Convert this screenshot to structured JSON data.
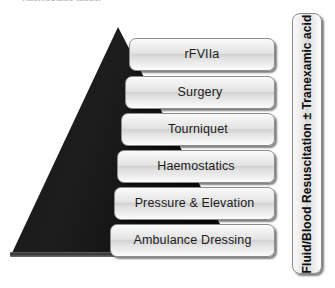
{
  "figure": {
    "title": "Haemostatic ladder",
    "caption_top": "Haemostatic ladder",
    "background_color": "#ffffff"
  },
  "pyramid": {
    "name": "haemostatic-ladder-triangle",
    "fill_color": "#1a1a1a",
    "base_color": "#3b3b3b",
    "apex": {
      "x": 118,
      "y": 27
    },
    "base_left": {
      "x": 12,
      "y": 256
    },
    "base_right": {
      "x": 235,
      "y": 256
    }
  },
  "ladder": {
    "direction_note": "Ambulance Dressing at base to rFVIIa at apex",
    "steps": [
      {
        "label": "rFVIIa",
        "level": 6,
        "left": 129,
        "top": 38
      },
      {
        "label": "Surgery",
        "level": 5,
        "left": 125,
        "top": 76
      },
      {
        "label": "Tourniquet",
        "level": 4,
        "left": 121,
        "top": 113
      },
      {
        "label": "Haemostatics",
        "level": 3,
        "left": 117,
        "top": 150
      },
      {
        "label": "Pressure & Elevation",
        "level": 2,
        "left": 114,
        "top": 187
      },
      {
        "label": "Ambulance Dressing",
        "level": 1,
        "left": 110,
        "top": 224
      }
    ]
  },
  "side_panel": {
    "label": "Fluid/Blood Resuscitation ± Tranexamic acid",
    "orientation": "vertical-bottom-to-top"
  },
  "colors": {
    "box_border": "#8d8d8d",
    "box_fill_light": "#fbfbfb",
    "box_fill_mid": "#d2d2d2",
    "text": "#1b1b1b",
    "triangle": "#1a1a1a"
  }
}
